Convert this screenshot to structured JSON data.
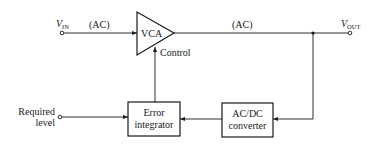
{
  "diagram": {
    "input": {
      "label_main": "V",
      "label_sub": "IN",
      "signal_label": "(AC)"
    },
    "output": {
      "label_main": "V",
      "label_sub": "OUT",
      "signal_label": "(AC)"
    },
    "vca": {
      "label": "VCA",
      "control_label": "Control"
    },
    "error_integrator": {
      "line1": "Error",
      "line2": "integrator"
    },
    "acdc_converter": {
      "line1": "AC/DC",
      "line2": "converter"
    },
    "reference": {
      "line1": "Required",
      "line2": "level"
    },
    "connections": [
      {
        "from": "input",
        "to": "vca"
      },
      {
        "from": "vca",
        "to": "output"
      },
      {
        "from": "output",
        "to": "acdc_converter"
      },
      {
        "from": "acdc_converter",
        "to": "error_integrator"
      },
      {
        "from": "reference",
        "to": "error_integrator"
      },
      {
        "from": "error_integrator",
        "to": "vca.control"
      }
    ]
  }
}
